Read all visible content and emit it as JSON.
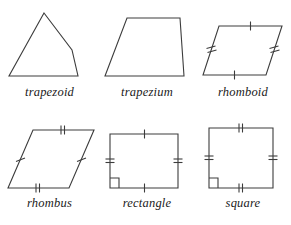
{
  "figure": {
    "background_color": "#ffffff",
    "stroke_color": "#3c3c3c",
    "label_color": "#1a1a1a",
    "rows": 2,
    "columns": 3
  },
  "shapes": [
    {
      "id": "trapezoid",
      "label": "trapezoid",
      "sides": 4,
      "vertices": [
        [
          44,
          9
        ],
        [
          72,
          46
        ],
        [
          78,
          72
        ],
        [
          9,
          72
        ]
      ],
      "tick_marks": [],
      "right_angle_marker": false
    },
    {
      "id": "trapezium",
      "label": "trapezium",
      "sides": 4,
      "vertices": [
        [
          28,
          14
        ],
        [
          81,
          14
        ],
        [
          85,
          72
        ],
        [
          6,
          72
        ]
      ],
      "tick_marks": [],
      "right_angle_marker": false
    },
    {
      "id": "rhomboid",
      "label": "rhomboid",
      "sides": 4,
      "vertices": [
        [
          24,
          22
        ],
        [
          87,
          22
        ],
        [
          71,
          71
        ],
        [
          8,
          71
        ]
      ],
      "tick_marks": [
        {
          "edge": "top",
          "count": 1
        },
        {
          "edge": "bottom",
          "count": 1
        },
        {
          "edge": "left",
          "count": 2
        },
        {
          "edge": "right",
          "count": 2
        }
      ],
      "right_angle_marker": false
    },
    {
      "id": "rhombus",
      "label": "rhombus",
      "sides": 4,
      "vertices": [
        [
          33,
          14
        ],
        [
          94,
          14
        ],
        [
          69,
          72
        ],
        [
          8,
          72
        ]
      ],
      "tick_marks": [
        {
          "edge": "top",
          "count": 2
        },
        {
          "edge": "bottom",
          "count": 2
        },
        {
          "edge": "left",
          "count": 1
        },
        {
          "edge": "right",
          "count": 1
        }
      ],
      "right_angle_marker": false
    },
    {
      "id": "rectangle",
      "label": "rectangle",
      "sides": 4,
      "vertices": [
        [
          11,
          18
        ],
        [
          79,
          18
        ],
        [
          79,
          72
        ],
        [
          11,
          72
        ]
      ],
      "tick_marks": [
        {
          "edge": "top",
          "count": 1
        },
        {
          "edge": "bottom",
          "count": 1
        },
        {
          "edge": "left",
          "count": 2
        },
        {
          "edge": "right",
          "count": 2
        }
      ],
      "right_angle_marker": true,
      "right_angle_corner": "bottom-left"
    },
    {
      "id": "square",
      "label": "square",
      "sides": 4,
      "vertices": [
        [
          14,
          12
        ],
        [
          78,
          12
        ],
        [
          78,
          72
        ],
        [
          14,
          72
        ]
      ],
      "tick_marks": [
        {
          "edge": "top",
          "count": 2
        },
        {
          "edge": "bottom",
          "count": 2
        },
        {
          "edge": "left",
          "count": 2
        },
        {
          "edge": "right",
          "count": 2
        }
      ],
      "right_angle_marker": true,
      "right_angle_corner": "bottom-left"
    }
  ]
}
